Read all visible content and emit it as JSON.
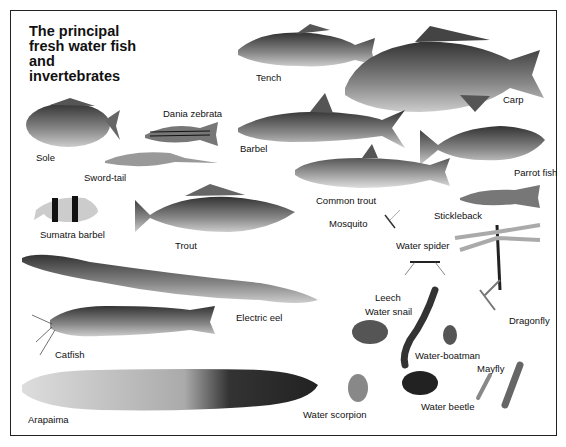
{
  "title": {
    "lines": [
      "The principal",
      "fresh water fish",
      "and",
      "invertebrates"
    ]
  },
  "fish": [
    {
      "name": "Tench",
      "label_pos": [
        256,
        72
      ]
    },
    {
      "name": "Carp",
      "label_pos": [
        503,
        94
      ]
    },
    {
      "name": "Dania zebrata",
      "label_pos": [
        163,
        110
      ]
    },
    {
      "name": "Sole",
      "label_pos": [
        36,
        152
      ]
    },
    {
      "name": "Barbel",
      "label_pos": [
        240,
        143
      ]
    },
    {
      "name": "Sword-tail",
      "label_pos": [
        84,
        170
      ]
    },
    {
      "name": "Parrot fish",
      "label_pos": [
        514,
        167
      ]
    },
    {
      "name": "Common trout",
      "label_pos": [
        316,
        195
      ]
    },
    {
      "name": "Stickleback",
      "label_pos": [
        434,
        210
      ]
    },
    {
      "name": "Sumatra barbel",
      "label_pos": [
        40,
        229
      ]
    },
    {
      "name": "Trout",
      "label_pos": [
        175,
        240
      ]
    },
    {
      "name": "Electric eel",
      "label_pos": [
        236,
        312
      ]
    },
    {
      "name": "Catfish",
      "label_pos": [
        55,
        349
      ]
    },
    {
      "name": "Arapaima",
      "label_pos": [
        28,
        414
      ]
    }
  ],
  "invertebrates": [
    {
      "name": "Mosquito",
      "label_pos": [
        329,
        218
      ]
    },
    {
      "name": "Water spider",
      "label_pos": [
        396,
        240
      ]
    },
    {
      "name": "Leech",
      "label_pos": [
        375,
        292
      ]
    },
    {
      "name": "Water snail",
      "label_pos": [
        365,
        306
      ]
    },
    {
      "name": "Dragonfly",
      "label_pos": [
        509,
        315
      ]
    },
    {
      "name": "Water-boatman",
      "label_pos": [
        415,
        350
      ]
    },
    {
      "name": "Mayfly",
      "label_pos": [
        477,
        363
      ]
    },
    {
      "name": "Water scorpion",
      "label_pos": [
        303,
        409
      ]
    },
    {
      "name": "Water beetle",
      "label_pos": [
        421,
        401
      ]
    }
  ],
  "labels": {
    "tench": "Tench",
    "carp": "Carp",
    "dania": "Dania zebrata",
    "sole": "Sole",
    "barbel": "Barbel",
    "swordtail": "Sword-tail",
    "parrot": "Parrot fish",
    "common_trout": "Common trout",
    "stickleback": "Stickleback",
    "sumatra": "Sumatra barbel",
    "trout": "Trout",
    "eel": "Electric eel",
    "catfish": "Catfish",
    "arapaima": "Arapaima",
    "mosquito": "Mosquito",
    "water_spider": "Water spider",
    "leech": "Leech",
    "water_snail": "Water snail",
    "dragonfly": "Dragonfly",
    "boatman": "Water-boatman",
    "mayfly": "Mayfly",
    "scorpion": "Water scorpion",
    "beetle": "Water beetle"
  },
  "colors": {
    "ink": "#111111",
    "frame": "#222222",
    "background": "#ffffff"
  }
}
